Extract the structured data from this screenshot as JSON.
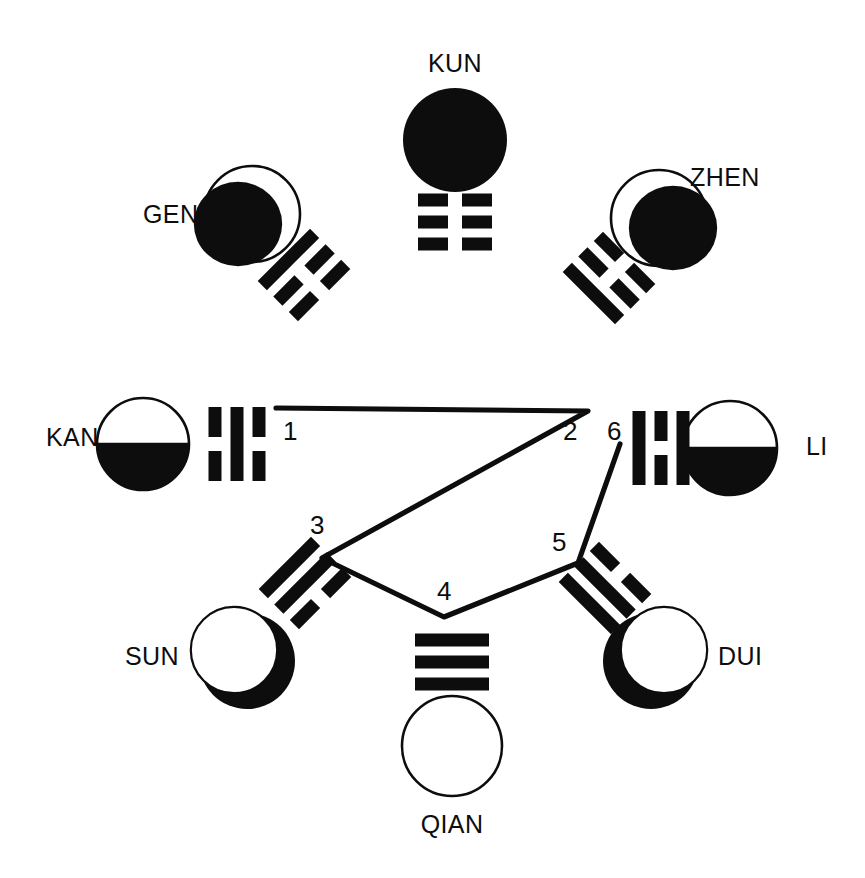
{
  "figure": {
    "title": "",
    "background_color": "#ffffff",
    "ink_color": "#0d0d0d",
    "width": 865,
    "height": 878
  },
  "trigrams": [
    {
      "id": "kun",
      "label": "KUN",
      "label_x": 455,
      "label_y": 72,
      "label_anchor": "middle",
      "moon_phase": "new-moon-dark",
      "moon_cx": 455,
      "moon_cy": 140,
      "moon_r": 52,
      "lines": [
        "yin",
        "yin",
        "yin"
      ],
      "trigram_x": 455,
      "trigram_y": 222,
      "trigram_rotation": 0
    },
    {
      "id": "gen",
      "label": "GEN",
      "label_x": 143,
      "label_y": 223,
      "label_anchor": "start",
      "moon_phase": "waning-gibbous-left",
      "moon_cx": 243,
      "moon_cy": 218,
      "moon_r": 48,
      "lines": [
        "yang",
        "yin",
        "yin"
      ],
      "trigram_x": 304,
      "trigram_y": 275,
      "trigram_rotation": -45
    },
    {
      "id": "zhen",
      "label": "ZHEN",
      "label_x": 690,
      "label_y": 186,
      "label_anchor": "start",
      "moon_phase": "waxing-gibbous-right",
      "moon_cx": 668,
      "moon_cy": 222,
      "moon_r": 48,
      "lines": [
        "yin",
        "yin",
        "yang"
      ],
      "trigram_x": 609,
      "trigram_y": 278,
      "trigram_rotation": 45
    },
    {
      "id": "kan",
      "label": "KAN",
      "label_x": 46,
      "label_y": 446,
      "label_anchor": "start",
      "moon_phase": "last-quarter-bottom",
      "moon_cx": 143,
      "moon_cy": 444,
      "moon_r": 46,
      "lines": [
        "yin",
        "yang",
        "yin"
      ],
      "trigram_x": 237,
      "trigram_y": 444,
      "trigram_rotation": -90
    },
    {
      "id": "li",
      "label": "LI",
      "label_x": 806,
      "label_y": 455,
      "label_anchor": "start",
      "moon_phase": "last-quarter-bottom",
      "moon_cx": 730,
      "moon_cy": 448,
      "moon_r": 47,
      "lines": [
        "yang",
        "yin",
        "yang"
      ],
      "trigram_x": 661,
      "trigram_y": 448,
      "trigram_rotation": -90
    },
    {
      "id": "sun",
      "label": "SUN",
      "label_x": 125,
      "label_y": 665,
      "label_anchor": "start",
      "moon_phase": "waning-crescent-right",
      "moon_cx": 247,
      "moon_cy": 661,
      "moon_r": 48,
      "lines": [
        "yang",
        "yang",
        "yin"
      ],
      "trigram_x": 305,
      "trigram_y": 583,
      "trigram_rotation": -45
    },
    {
      "id": "dui",
      "label": "DUI",
      "label_x": 718,
      "label_y": 665,
      "label_anchor": "start",
      "moon_phase": "waxing-crescent-left",
      "moon_cx": 651,
      "moon_cy": 661,
      "moon_r": 48,
      "lines": [
        "yin",
        "yang",
        "yang"
      ],
      "trigram_x": 605,
      "trigram_y": 588,
      "trigram_rotation": 45
    },
    {
      "id": "qian",
      "label": "QIAN",
      "label_x": 452,
      "label_y": 833,
      "label_anchor": "middle",
      "moon_phase": "full-moon-light",
      "moon_cx": 452,
      "moon_cy": 746,
      "moon_r": 50,
      "lines": [
        "yang",
        "yang",
        "yang"
      ],
      "trigram_x": 452,
      "trigram_y": 662,
      "trigram_rotation": 0
    }
  ],
  "path": {
    "id": "sequence-path",
    "description": "connecting polyline through nodes 1-6",
    "points": [
      {
        "n": "1",
        "x": 276,
        "y": 408,
        "label_x": 283,
        "label_y": 440,
        "label_anchor": "start"
      },
      {
        "n": "2",
        "x": 588,
        "y": 411,
        "label_x": 563,
        "label_y": 440,
        "label_anchor": "start"
      },
      {
        "n": "3",
        "x": 322,
        "y": 558,
        "label_x": 310,
        "label_y": 534,
        "label_anchor": "start"
      },
      {
        "n": "4",
        "x": 444,
        "y": 617,
        "label_x": 437,
        "label_y": 600,
        "label_anchor": "start"
      },
      {
        "n": "5",
        "x": 578,
        "y": 563,
        "label_x": 552,
        "label_y": 551,
        "label_anchor": "start"
      },
      {
        "n": "6",
        "x": 620,
        "y": 444,
        "label_x": 607,
        "label_y": 440,
        "label_anchor": "start"
      }
    ],
    "stroke_color": "#0d0d0d",
    "stroke_width": 5.2
  },
  "line_glyph": {
    "yang_label": "solid (unbroken) line",
    "yin_label": "broken line",
    "bar_width": 74,
    "bar_height": 13,
    "bar_gap": 22,
    "yin_gap": 14
  }
}
